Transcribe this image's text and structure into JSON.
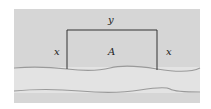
{
  "diagram": {
    "labels": {
      "top": "y",
      "left": "x",
      "right": "x",
      "area": "A"
    },
    "colors": {
      "background": "#d6d6d6",
      "river": "#e3e3e3",
      "fence": "#333333",
      "riverbank": "#9a9a9a"
    }
  }
}
